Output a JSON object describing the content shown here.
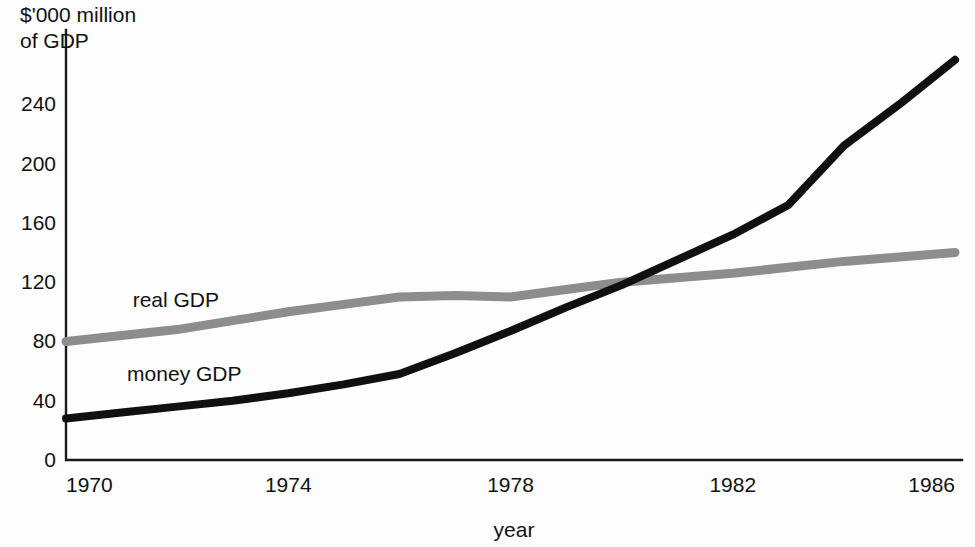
{
  "chart_data": {
    "type": "line",
    "title": "",
    "subtitle": "",
    "ylabel_line1": "$'000 million",
    "ylabel_line2": "of GDP",
    "xlabel": "year",
    "x": [
      1970,
      1971,
      1972,
      1973,
      1974,
      1975,
      1976,
      1977,
      1978,
      1979,
      1980,
      1981,
      1982,
      1983,
      1984,
      1985,
      1986
    ],
    "xlim": [
      1970,
      1986
    ],
    "ylim": [
      0,
      280
    ],
    "xticks": [
      "1970",
      "1974",
      "1978",
      "1982",
      "1986"
    ],
    "xtick_values": [
      1970,
      1974,
      1978,
      1982,
      1986
    ],
    "yticks": [
      "0",
      "40",
      "80",
      "120",
      "160",
      "200",
      "240"
    ],
    "ytick_values": [
      0,
      40,
      80,
      120,
      160,
      200,
      240
    ],
    "grid": false,
    "legend_position": "inline-annotation",
    "series": [
      {
        "name": "real GDP",
        "color": "#8d8d8d",
        "stroke_width": 9,
        "label_x": 1971.2,
        "label_y": 103,
        "values": [
          80,
          84,
          88,
          94,
          100,
          105,
          110,
          111,
          110,
          115,
          120,
          123,
          126,
          130,
          134,
          137,
          140
        ]
      },
      {
        "name": "money GDP",
        "color": "#101010",
        "stroke_width": 8,
        "label_x": 1971.1,
        "label_y": 53,
        "values": [
          28,
          32,
          36,
          40,
          45,
          51,
          58,
          72,
          87,
          103,
          118,
          135,
          152,
          172,
          212,
          240,
          270
        ]
      }
    ],
    "annotations": [
      {
        "text": "real GDP",
        "series": "real GDP"
      },
      {
        "text": "money GDP",
        "series": "money GDP"
      }
    ]
  },
  "axes": {
    "y_axis_name": "y-axis",
    "x_axis_name": "x-axis"
  }
}
